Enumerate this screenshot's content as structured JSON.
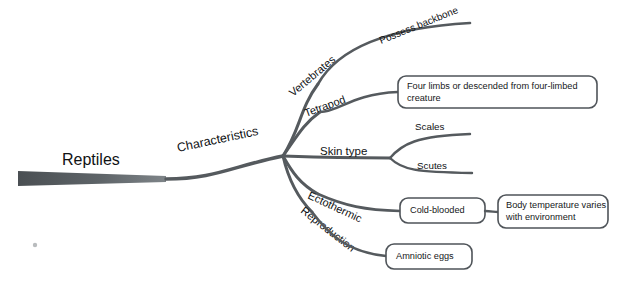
{
  "diagram": {
    "type": "mind-map",
    "background_color": "#ffffff",
    "line_color": "#555a5e",
    "text_color": "#101214",
    "trunk_color_dark": "#4a4f53",
    "trunk_color_light": "#8d9296"
  },
  "root": {
    "label": "Reptiles"
  },
  "trunk_branch": {
    "label": "Characteristics"
  },
  "branches": [
    {
      "id": "vertebrates",
      "label": "Vertebrates",
      "children": [
        {
          "id": "possess-backbone",
          "label": "Possess backbone",
          "style": "line-label"
        }
      ]
    },
    {
      "id": "tetrapod",
      "label": "Tetrapod",
      "children": [
        {
          "id": "four-limbs",
          "label": "Four limbs or descended from four-limbed creature",
          "style": "box",
          "lines": [
            "Four limbs or descended from four-limbed",
            "creature"
          ]
        }
      ]
    },
    {
      "id": "skin-type",
      "label": "Skin type",
      "children": [
        {
          "id": "scales",
          "label": "Scales",
          "style": "line-label"
        },
        {
          "id": "scutes",
          "label": "Scutes",
          "style": "line-label"
        }
      ]
    },
    {
      "id": "ectothermic",
      "label": "Ectothermic",
      "children": [
        {
          "id": "cold-blooded",
          "label": "Cold-blooded",
          "style": "box",
          "lines": [
            "Cold-blooded"
          ],
          "children": [
            {
              "id": "body-temperature",
              "label": "Body temperature varies with environment",
              "style": "box",
              "lines": [
                "Body temperature varies",
                "with environment"
              ]
            }
          ]
        }
      ]
    },
    {
      "id": "reproduction",
      "label": "Reproduction",
      "children": [
        {
          "id": "amniotic-eggs",
          "label": "Amniotic eggs",
          "style": "box",
          "lines": [
            "Amniotic eggs"
          ]
        }
      ]
    }
  ]
}
